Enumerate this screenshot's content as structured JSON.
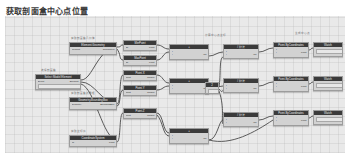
{
  "page": {
    "title": "获取剖面盒中心点位置",
    "background": "#ffffff"
  },
  "canvas": {
    "name": "node-graph-canvas",
    "background": "#e9e9e9",
    "grid": true,
    "width": 340,
    "height": 137
  },
  "palette": {
    "node_header": "#3b3b3b",
    "node_body": "#d2d2d2",
    "node_border": "#9c9c9c",
    "wire": "#4a4a4a",
    "caption": "#6d6d6d",
    "selected": "#4a82c8"
  },
  "captions": [
    {
      "text": "选择剖面盒",
      "x": 36,
      "y": 53
    },
    {
      "text": "获取剖面盒几何体",
      "x": 66,
      "y": 21
    },
    {
      "text": "获取剖面盒边界框",
      "x": 66,
      "y": 76
    },
    {
      "text": "获取坐标值",
      "x": 66,
      "y": 114
    },
    {
      "text": "计算中心点坐标",
      "x": 200,
      "y": 18
    },
    {
      "text": "生成中心点",
      "x": 290,
      "y": 16
    }
  ],
  "nodes": [
    {
      "id": "n01",
      "name": "select-section-box",
      "title": "Select Model Element",
      "x": 30,
      "y": 58,
      "w": 46,
      "h": 16,
      "ports": [
        {
          "in": "Select",
          "out": "Element"
        },
        {
          "in": "",
          "out": ""
        }
      ],
      "field": true
    },
    {
      "id": "n02",
      "name": "element-geometry",
      "title": "Element.Geometry",
      "x": 64,
      "y": 26,
      "w": 48,
      "h": 13,
      "ports": [
        {
          "in": "element",
          "out": "Geometry[]"
        }
      ],
      "field": false
    },
    {
      "id": "n03",
      "name": "geometry-bounding-box",
      "title": "Geometry.BoundingBox",
      "x": 64,
      "y": 81,
      "w": 48,
      "h": 13,
      "ports": [
        {
          "in": "geometry",
          "out": "BoundingBox"
        }
      ],
      "field": false
    },
    {
      "id": "n04",
      "name": "coordinate-system",
      "title": "CoordinateSystem",
      "x": 64,
      "y": 119,
      "w": 48,
      "h": 12,
      "ports": [
        {
          "in": "cs",
          "out": "Point"
        }
      ],
      "field": false
    },
    {
      "id": "n05",
      "name": "bbox-min-point",
      "title": "MinPoint",
      "x": 118,
      "y": 24,
      "w": 34,
      "h": 11,
      "ports": [
        {
          "in": "bb",
          "out": "Point"
        }
      ],
      "field": false
    },
    {
      "id": "n06",
      "name": "bbox-max-point",
      "title": "MaxPoint",
      "x": 118,
      "y": 39,
      "w": 34,
      "h": 11,
      "ports": [
        {
          "in": "bb",
          "out": "Point"
        }
      ],
      "field": false
    },
    {
      "id": "n07",
      "name": "point-x",
      "title": "Point.X",
      "x": 118,
      "y": 54,
      "w": 34,
      "h": 11,
      "ports": [
        {
          "in": "point",
          "out": "double"
        }
      ],
      "field": false
    },
    {
      "id": "n08",
      "name": "point-y",
      "title": "Point.Y",
      "x": 118,
      "y": 69,
      "w": 34,
      "h": 11,
      "ports": [
        {
          "in": "point",
          "out": "double"
        }
      ],
      "field": false
    },
    {
      "id": "n09",
      "name": "point-z",
      "title": "Point.Z",
      "x": 118,
      "y": 92,
      "w": 34,
      "h": 11,
      "ports": [
        {
          "in": "point",
          "out": "double"
        }
      ],
      "field": false
    },
    {
      "id": "n10",
      "name": "add-node-1",
      "title": "+",
      "x": 164,
      "y": 28,
      "w": 40,
      "h": 16,
      "ports": [
        {
          "in": "x",
          "out": ""
        },
        {
          "in": "y",
          "out": "var"
        }
      ],
      "field": false
    },
    {
      "id": "n11",
      "name": "add-node-2",
      "title": "+",
      "x": 164,
      "y": 62,
      "w": 40,
      "h": 16,
      "ports": [
        {
          "in": "x",
          "out": ""
        },
        {
          "in": "y",
          "out": "var"
        }
      ],
      "field": false
    },
    {
      "id": "n12",
      "name": "add-node-3",
      "title": "+",
      "x": 164,
      "y": 112,
      "w": 40,
      "h": 16,
      "ports": [
        {
          "in": "x",
          "out": ""
        },
        {
          "in": "y",
          "out": "var"
        }
      ],
      "field": false
    },
    {
      "id": "n13",
      "name": "number-two",
      "title": "2",
      "x": 200,
      "y": 66,
      "w": 14,
      "h": 12,
      "ports": [
        {
          "in": "",
          "out": ""
        }
      ],
      "field": true
    },
    {
      "id": "n14",
      "name": "divide-node-1",
      "title": "/ 除法",
      "x": 218,
      "y": 28,
      "w": 36,
      "h": 15,
      "ports": [
        {
          "in": "x",
          "out": ""
        },
        {
          "in": "y",
          "out": "var"
        }
      ],
      "field": false
    },
    {
      "id": "n15",
      "name": "divide-node-2",
      "title": "/ 除法",
      "x": 218,
      "y": 62,
      "w": 36,
      "h": 15,
      "ports": [
        {
          "in": "x",
          "out": ""
        },
        {
          "in": "y",
          "out": "var"
        }
      ],
      "field": false
    },
    {
      "id": "n16",
      "name": "divide-node-3",
      "title": "/ 除法",
      "x": 218,
      "y": 96,
      "w": 36,
      "h": 15,
      "ports": [
        {
          "in": "x",
          "out": ""
        },
        {
          "in": "y",
          "out": "var"
        }
      ],
      "field": false
    },
    {
      "id": "n17",
      "name": "point-bycoordinates-1",
      "title": "Point.ByCoordinates",
      "x": 268,
      "y": 26,
      "w": 36,
      "h": 16,
      "ports": [
        {
          "in": "x",
          "out": ""
        },
        {
          "in": "y",
          "out": "Point"
        }
      ],
      "field": false
    },
    {
      "id": "n18",
      "name": "point-bycoordinates-2",
      "title": "Point.ByCoordinates",
      "x": 268,
      "y": 60,
      "w": 36,
      "h": 16,
      "ports": [
        {
          "in": "x",
          "out": ""
        },
        {
          "in": "y",
          "out": "Point"
        }
      ],
      "field": false
    },
    {
      "id": "n19",
      "name": "point-bycoordinates-3",
      "title": "Point.ByCoordinates",
      "x": 268,
      "y": 94,
      "w": 36,
      "h": 16,
      "ports": [
        {
          "in": "x",
          "out": ""
        },
        {
          "in": "y",
          "out": "Point"
        }
      ],
      "field": false
    },
    {
      "id": "n20",
      "name": "watch-node-1",
      "title": "Watch",
      "x": 308,
      "y": 26,
      "w": 30,
      "h": 15,
      "ports": [
        {
          "in": "",
          "out": ""
        }
      ],
      "field": true
    },
    {
      "id": "n21",
      "name": "watch-node-2",
      "title": "Watch",
      "x": 308,
      "y": 60,
      "w": 30,
      "h": 15,
      "ports": [
        {
          "in": "",
          "out": ""
        }
      ],
      "field": true
    },
    {
      "id": "n22",
      "name": "watch-node-3",
      "title": "Watch",
      "x": 308,
      "y": 94,
      "w": 30,
      "h": 15,
      "ports": [
        {
          "in": "",
          "out": ""
        }
      ],
      "field": true
    }
  ],
  "wires": [
    "M76,64 C88,64 92,32 112,32",
    "M76,66 C90,66 96,87 112,87",
    "M76,68 C90,72 98,124 112,124",
    "M112,31 C118,31 114,29 118,29",
    "M112,33 C116,38 114,44 118,44",
    "M112,88 C116,88 114,59 118,59",
    "M112,90 C116,90 114,74 118,74",
    "M112,126 C116,126 114,97 118,97",
    "M152,29 C158,29 158,33 164,33",
    "M152,44 C158,44 158,36 164,36",
    "M152,59 C158,59 158,67 164,67",
    "M152,74 C158,74 158,70 164,70",
    "M152,97 C158,97 158,117 164,117",
    "M152,99 C158,105 158,120 164,120",
    "M204,40 C210,40 212,36 218,36",
    "M204,74 C210,74 212,70 218,70",
    "M204,124 C212,124 214,104 218,104",
    "M214,71 C216,60 214,42 218,41",
    "M214,73 C218,78 216,74 218,75",
    "M214,75 C220,92 216,106 218,108",
    "M254,36 C260,36 262,32 268,32",
    "M254,70 C260,70 262,66 268,66",
    "M254,104 C260,104 262,100 268,100",
    "M304,34 C306,34 306,32 308,32",
    "M304,68 C306,68 306,66 308,66",
    "M304,102 C306,102 306,100 308,100",
    "M204,124 C226,130 250,116 268,104"
  ]
}
